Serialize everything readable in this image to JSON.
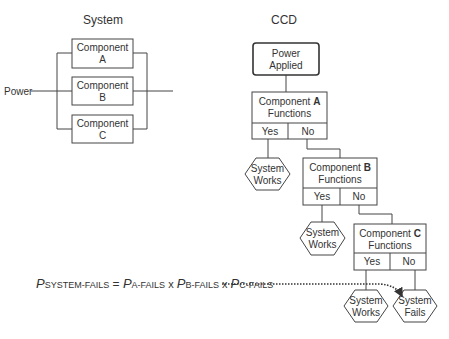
{
  "system": {
    "title": "System",
    "power_label": "Power",
    "components": [
      {
        "line1": "Component",
        "line2": "A"
      },
      {
        "line1": "Component",
        "line2": "B"
      },
      {
        "line1": "Component",
        "line2": "C"
      }
    ]
  },
  "ccd": {
    "title": "CCD",
    "start": {
      "line1": "Power",
      "line2": "Applied"
    },
    "decisions": [
      {
        "prefix": "Component ",
        "letter": "A",
        "line2": "Functions",
        "yes": "Yes",
        "no": "No"
      },
      {
        "prefix": "Component ",
        "letter": "B",
        "line2": "Functions",
        "yes": "Yes",
        "no": "No"
      },
      {
        "prefix": "Component ",
        "letter": "C",
        "line2": "Functions",
        "yes": "Yes",
        "no": "No"
      }
    ],
    "outcomes": [
      {
        "line1": "System",
        "line2": "Works"
      },
      {
        "line1": "System",
        "line2": "Works"
      },
      {
        "line1": "System",
        "line2": "Works"
      },
      {
        "line1": "System",
        "line2": "Fails"
      }
    ]
  },
  "equation": {
    "p": "P",
    "sub_system": "SYSTEM-FAILS",
    "equals": " = ",
    "sub_a": "A-FAILS",
    "sub_b": "B-FAILS",
    "sub_c": "C-FAILS",
    "times": " x "
  }
}
